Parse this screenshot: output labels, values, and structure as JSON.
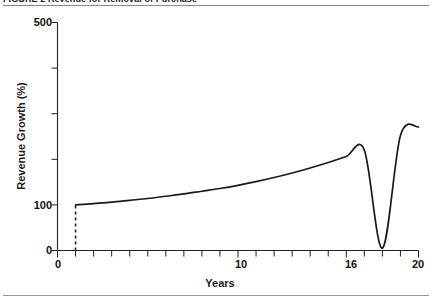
{
  "figure": {
    "number_label": "FIGURE 2",
    "caption": "Revenue for Removal of Purchase",
    "full_caption": "FIGURE 2 Revenue for Removal of Purchase"
  },
  "chart_data": {
    "type": "line",
    "title": "Revenue for Removal of Purchase",
    "xlabel": "Years",
    "ylabel": "Revenue Growth (%)",
    "xlim": [
      0,
      20
    ],
    "ylim": [
      0,
      500
    ],
    "grid": false,
    "legend": null,
    "x_ticks_major": [
      0,
      10,
      16,
      20
    ],
    "x_tick_labels": [
      "0",
      "10",
      "16",
      "20"
    ],
    "x_ticks_minor": [
      1,
      2,
      3,
      4,
      5,
      6,
      7,
      8,
      9,
      11,
      12,
      13,
      14,
      15,
      17,
      18,
      19
    ],
    "y_ticks_major": [
      0,
      100,
      500
    ],
    "y_tick_labels": [
      "0",
      "100",
      "500"
    ],
    "y_ticks_minor": [
      200,
      300,
      400
    ],
    "series": [
      {
        "name": "Revenue Growth",
        "style": "solid",
        "color": "#1a1a1a",
        "x": [
          1,
          2,
          3,
          4,
          5,
          6,
          7,
          8,
          9,
          10,
          11,
          12,
          13,
          14,
          15,
          16,
          17,
          18,
          19,
          20
        ],
        "y": [
          100,
          103,
          106,
          110,
          114,
          119,
          124,
          130,
          136,
          143,
          151,
          160,
          170,
          181,
          193,
          206,
          220,
          5,
          252,
          271
        ]
      },
      {
        "name": "Purchase removal marker",
        "style": "dashed",
        "color": "#1a1a1a",
        "x": [
          1,
          1
        ],
        "y": [
          0,
          100
        ]
      }
    ],
    "annotations": []
  },
  "axis_labels": {
    "y_500": "500",
    "y_100": "100",
    "y_0": "0",
    "x_0": "0",
    "x_10": "10",
    "x_16": "16",
    "x_20": "20",
    "y_title": "Revenue Growth (%)",
    "x_title": "Years"
  }
}
